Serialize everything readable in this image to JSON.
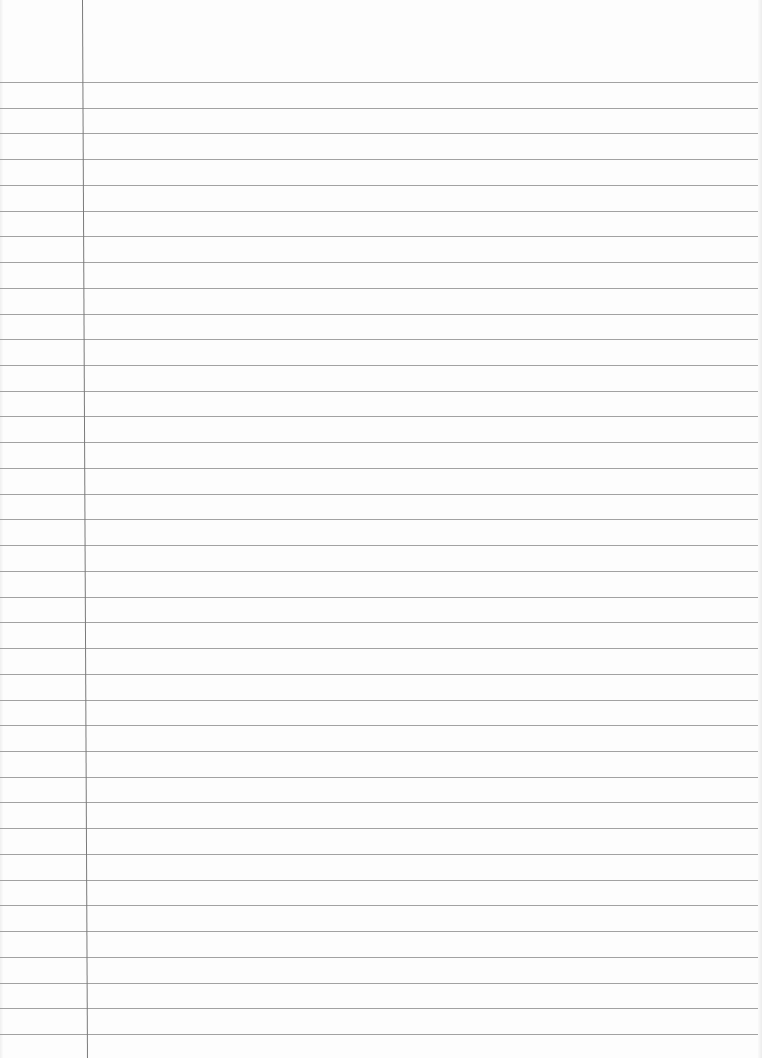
{
  "page": {
    "type": "ruled-notebook-paper",
    "background_color": "#fdfdfd",
    "rule_color": "#a2a2a2",
    "margin_line_color": "#7a7a7a",
    "first_rule_y": 82,
    "rule_spacing_px": 25.73,
    "rule_count": 38,
    "margin_line_x_top": 82,
    "margin_line_x_bottom": 87
  }
}
